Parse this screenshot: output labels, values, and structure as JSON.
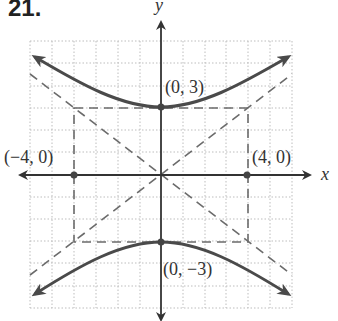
{
  "problem_number": "21.",
  "axes": {
    "x_label": "x",
    "y_label": "y"
  },
  "points": [
    {
      "label": "(0, 3)",
      "x": 0,
      "y": 3
    },
    {
      "label": "(0, −3)",
      "x": 0,
      "y": -3
    },
    {
      "label": "(−4, 0)",
      "x": -4,
      "y": 0
    },
    {
      "label": "(4, 0)",
      "x": 4,
      "y": 0
    }
  ],
  "hyperbola": {
    "equation": "y^2/9 - x^2/16 = 1",
    "a": 3,
    "b": 4,
    "orientation": "vertical"
  },
  "asymptotes": [
    "y = 3/4 x",
    "y = -3/4 x"
  ],
  "grid": {
    "xmin": -6,
    "xmax": 6,
    "ymin": -6,
    "ymax": 6
  },
  "colors": {
    "curve": "#4a4a4a",
    "dashed": "#6b6b6b",
    "grid": "#bdbdbd",
    "axis": "#333333"
  }
}
